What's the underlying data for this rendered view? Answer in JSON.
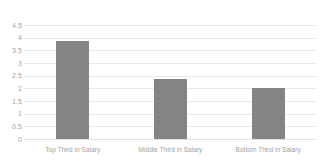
{
  "chart_data": {
    "type": "bar",
    "title": "",
    "xlabel": "",
    "ylabel": "",
    "categories": [
      "Top Third in Salary",
      "Middle Third in Salary",
      "Bottom Third in Salary"
    ],
    "values": [
      3.87,
      2.35,
      2.03
    ],
    "ylim": [
      0,
      4.5
    ],
    "ytick_labels": [
      "4.5",
      "4",
      "3.5",
      "3",
      "2.5",
      "2",
      "1.5",
      "1",
      "0.5",
      "0"
    ],
    "ytick_values": [
      4.5,
      4,
      3.5,
      3,
      2.5,
      2,
      1.5,
      1,
      0.5,
      0
    ],
    "grid": true,
    "legend": false,
    "legend_position": "none",
    "series": [
      {
        "name": "",
        "values": [
          3.87,
          2.35,
          2.03
        ]
      }
    ],
    "colors": {
      "bar": "#848484",
      "gridline": "#e9e9e9",
      "baseline": "#e2e2e2",
      "tick_label": "#a3a3a3",
      "category_label": "#9e9e9e",
      "background": "#ffffff"
    }
  }
}
